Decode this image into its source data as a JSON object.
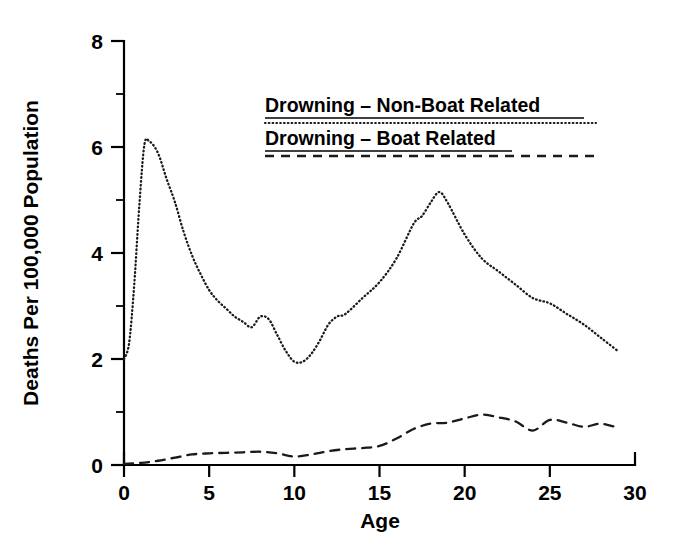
{
  "chart_data": {
    "type": "line",
    "title": "",
    "xlabel": "Age",
    "ylabel": "Deaths Per 100,000 Population",
    "xlim": [
      0,
      30
    ],
    "ylim": [
      0,
      8
    ],
    "xticks": [
      0,
      5,
      10,
      15,
      20,
      25,
      30
    ],
    "xtick_labels": [
      "0",
      "5",
      "10",
      "15",
      "20",
      "25",
      "30"
    ],
    "yticks": [
      0,
      2,
      4,
      6,
      8
    ],
    "ytick_labels": [
      "0",
      "2",
      "4",
      "6",
      "8"
    ],
    "yticks_minor": [
      1,
      3,
      5,
      7
    ],
    "grid": false,
    "legend_position": "upper-center",
    "series": [
      {
        "name": "Drowning - Non-Boat Related",
        "style": "dotted",
        "color": "#1a1a1a",
        "x": [
          0,
          0.3,
          0.6,
          0.9,
          1.2,
          1.5,
          1.8,
          2.1,
          2.5,
          3.0,
          3.5,
          4.0,
          4.5,
          5.0,
          5.5,
          6.0,
          6.5,
          7.0,
          7.5,
          8.0,
          8.5,
          9.0,
          9.5,
          10.0,
          10.5,
          11.0,
          11.5,
          12.0,
          12.5,
          13.0,
          14.0,
          15.0,
          16.0,
          17.0,
          17.5,
          18.0,
          18.5,
          19.0,
          20.0,
          21.0,
          22.0,
          23.0,
          24.0,
          25.0,
          26.0,
          27.0,
          28.0,
          29.0
        ],
        "y": [
          2.0,
          2.3,
          3.4,
          4.9,
          6.05,
          6.1,
          6.0,
          5.8,
          5.4,
          4.95,
          4.4,
          3.95,
          3.6,
          3.3,
          3.1,
          2.95,
          2.8,
          2.7,
          2.6,
          2.8,
          2.75,
          2.45,
          2.15,
          1.95,
          1.95,
          2.1,
          2.35,
          2.65,
          2.8,
          2.85,
          3.15,
          3.45,
          3.9,
          4.55,
          4.7,
          4.95,
          5.15,
          4.95,
          4.35,
          3.9,
          3.65,
          3.4,
          3.15,
          3.05,
          2.85,
          2.65,
          2.4,
          2.15
        ]
      },
      {
        "name": "Drowning - Boat Related",
        "style": "dashed",
        "color": "#1a1a1a",
        "x": [
          0,
          1,
          2,
          3,
          4,
          5,
          6,
          7,
          8,
          9,
          10,
          11,
          12,
          13,
          14,
          15,
          16,
          17,
          18,
          19,
          20,
          21,
          22,
          23,
          24,
          25,
          26,
          27,
          28,
          29
        ],
        "y": [
          0.02,
          0.04,
          0.08,
          0.14,
          0.2,
          0.22,
          0.23,
          0.24,
          0.25,
          0.22,
          0.16,
          0.2,
          0.26,
          0.3,
          0.32,
          0.36,
          0.5,
          0.68,
          0.78,
          0.8,
          0.88,
          0.95,
          0.9,
          0.82,
          0.65,
          0.85,
          0.8,
          0.72,
          0.78,
          0.7
        ]
      }
    ]
  },
  "legend": {
    "entries": [
      {
        "label": "Drowning  –  Non-Boat Related",
        "style": "dotted"
      },
      {
        "label": "Drowning  –  Boat Related",
        "style": "dashed"
      }
    ]
  }
}
